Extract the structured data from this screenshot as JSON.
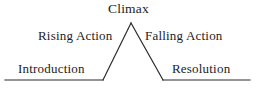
{
  "diagram": {
    "name": "Plot Diagram (Freytag's Pyramid)",
    "type": "line-drawing",
    "background_color": "#ffffff",
    "line_color": "#2b2b2b",
    "text_color": "#1c1c1c",
    "labels": {
      "climax": "Climax",
      "rising_action": "Rising Action",
      "falling_action": "Falling Action",
      "introduction": "Introduction",
      "resolution": "Resolution"
    },
    "geometry": {
      "baseline_y": 80,
      "baseline_left_x": 5,
      "baseline_right_x": 250,
      "apex_x": 131,
      "apex_y": 23,
      "left_vertex_x": 103,
      "right_vertex_x": 163,
      "stroke_width": 1.2
    }
  }
}
